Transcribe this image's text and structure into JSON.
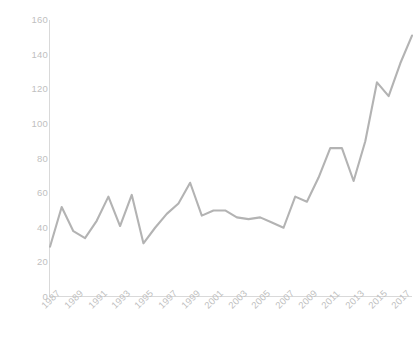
{
  "chart_data": {
    "type": "line",
    "title": "",
    "subtitle": "",
    "xlabel": "",
    "ylabel": "",
    "grid": false,
    "legend": false,
    "legend_position": "none",
    "line_color": "#b3b3b3",
    "axis_color": "#d9d9d9",
    "tick_label_color": "#bfbfbf",
    "xlim": [
      1987,
      2018
    ],
    "ylim": [
      0,
      160
    ],
    "y_ticks": [
      0,
      20,
      40,
      60,
      80,
      100,
      120,
      140,
      160
    ],
    "y_tick_labels": [
      "0",
      "20",
      "40",
      "60",
      "80",
      "100",
      "120",
      "140",
      "160"
    ],
    "x_ticks": [
      1987,
      1989,
      1991,
      1993,
      1995,
      1997,
      1999,
      2001,
      2003,
      2005,
      2007,
      2009,
      2011,
      2013,
      2015,
      2017
    ],
    "x_tick_labels": [
      "1987",
      "1989",
      "1991",
      "1993",
      "1995",
      "1997",
      "1999",
      "2001",
      "2003",
      "2005",
      "2007",
      "2009",
      "2011",
      "2013",
      "2015",
      "2017"
    ],
    "x": [
      1987,
      1988,
      1989,
      1990,
      1991,
      1992,
      1993,
      1994,
      1995,
      1996,
      1997,
      1998,
      1999,
      2000,
      2001,
      2002,
      2003,
      2004,
      2005,
      2006,
      2007,
      2008,
      2009,
      2010,
      2011,
      2012,
      2013,
      2014,
      2015,
      2016,
      2017,
      2018
    ],
    "series": [
      {
        "name": "Series 1",
        "values": [
          29,
          52,
          38,
          34,
          44,
          58,
          41,
          59,
          31,
          40,
          48,
          54,
          66,
          47,
          50,
          50,
          46,
          45,
          46,
          43,
          40,
          58,
          55,
          69,
          86,
          86,
          67,
          90,
          124,
          116,
          135,
          151
        ]
      }
    ]
  }
}
